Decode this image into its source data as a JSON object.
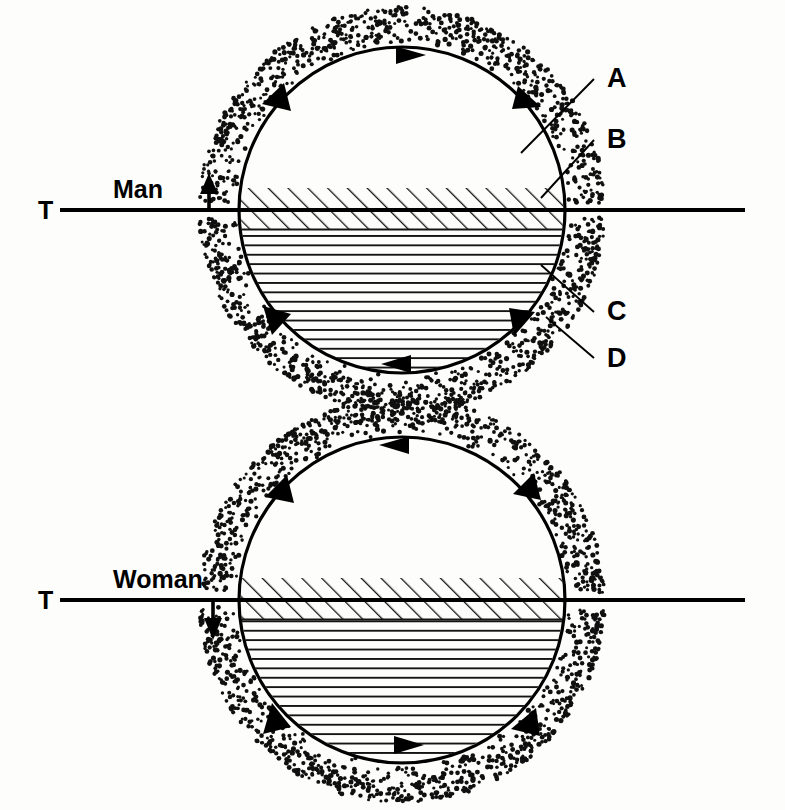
{
  "figure": {
    "title": "",
    "background_color": "#fdfdfb",
    "ink_color": "#000000",
    "width": 785,
    "height": 810
  },
  "panels": [
    {
      "id": "upper",
      "subject_label": "Man",
      "baseline_label": "T",
      "flow_direction": "clockwise",
      "vertical_arrow": "up",
      "circle": {
        "cx": 402,
        "cy": 210,
        "r": 163
      },
      "diagonal_band": {
        "top": 188,
        "bottom": 229
      },
      "horizontal_band": {
        "top": 229,
        "bottom": 355
      },
      "baseline": {
        "y": 210,
        "x_start": 60,
        "x_end": 745
      },
      "subject_arrow": {
        "x": 209,
        "y_tail": 212,
        "y_head": 176
      }
    },
    {
      "id": "lower",
      "subject_label": "Woman",
      "baseline_label": "T",
      "flow_direction": "counter-clockwise",
      "vertical_arrow": "down",
      "circle": {
        "cx": 402,
        "cy": 600,
        "r": 163
      },
      "diagonal_band": {
        "top": 578,
        "bottom": 619
      },
      "horizontal_band": {
        "top": 619,
        "bottom": 745
      },
      "baseline": {
        "y": 600,
        "x_start": 60,
        "x_end": 745
      },
      "subject_arrow": {
        "x": 213,
        "y_tail": 601,
        "y_head": 638
      }
    }
  ],
  "callouts": [
    {
      "key": "A",
      "label": "A",
      "text_x": 607,
      "text_y": 87,
      "line": {
        "x1": 521,
        "y1": 153,
        "x2": 594,
        "y2": 79
      }
    },
    {
      "key": "B",
      "label": "B",
      "text_x": 607,
      "text_y": 148,
      "line": {
        "x1": 541,
        "y1": 198,
        "x2": 594,
        "y2": 140
      }
    },
    {
      "key": "C",
      "label": "C",
      "text_x": 607,
      "text_y": 320,
      "line": {
        "x1": 541,
        "y1": 265,
        "x2": 594,
        "y2": 312
      }
    },
    {
      "key": "D",
      "label": "D",
      "text_x": 607,
      "text_y": 367,
      "line": {
        "x1": 546,
        "y1": 317,
        "x2": 594,
        "y2": 358
      }
    }
  ],
  "legend_meaning": {
    "A": "A",
    "B": "B",
    "C": "C",
    "D": "D"
  }
}
